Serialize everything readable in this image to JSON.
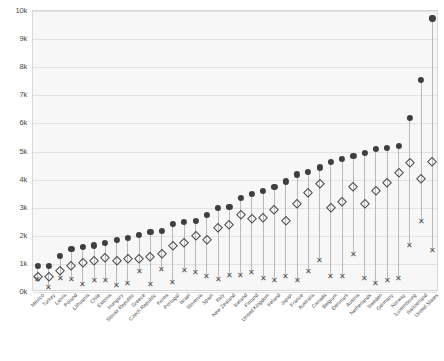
{
  "chart_data": {
    "type": "scatter",
    "title": "",
    "subtitle": "",
    "xlabel": "",
    "ylabel": "",
    "ylim": [
      0,
      10000
    ],
    "yticks": [
      0,
      1000,
      2000,
      3000,
      4000,
      5000,
      6000,
      7000,
      8000,
      9000,
      10000
    ],
    "ytick_labels": [
      "0k",
      "1k",
      "2k",
      "3k",
      "4k",
      "5k",
      "6k",
      "7k",
      "8k",
      "9k",
      "10k"
    ],
    "grid": true,
    "legend_position": "none",
    "categories": [
      "Mexico",
      "Turkey",
      "Latvia",
      "Poland",
      "Lithuania",
      "Chile",
      "Estonia",
      "Hungary",
      "Slovak Republic",
      "Greece",
      "Czech Republic",
      "Korea",
      "Portugal",
      "Israel",
      "Slovenia",
      "Spain",
      "Italy",
      "New Zealand",
      "Iceland",
      "Finland",
      "United Kingdom",
      "Ireland",
      "Japan",
      "France",
      "Australia",
      "Canada",
      "Belgium",
      "Denmark",
      "Austria",
      "Netherlands",
      "Sweden",
      "Germany",
      "Norway",
      "Luxembourg",
      "Switzerland",
      "United States"
    ],
    "series": [
      {
        "name": "total",
        "marker": "filled-circle",
        "color": "#3f3f3f",
        "values": [
          880,
          900,
          1250,
          1500,
          1560,
          1620,
          1700,
          1830,
          1900,
          2000,
          2100,
          2150,
          2400,
          2450,
          2500,
          2700,
          2950,
          3000,
          3300,
          3450,
          3550,
          3700,
          3900,
          4150,
          4250,
          4400,
          4600,
          4700,
          4800,
          4900,
          5050,
          5100,
          5150,
          6150,
          7500,
          9700
        ]
      },
      {
        "name": "middle",
        "marker": "open-diamond",
        "color": "#4a4a4a",
        "values": [
          490,
          500,
          720,
          900,
          1000,
          1080,
          1180,
          1060,
          1150,
          1150,
          1200,
          1300,
          1600,
          1700,
          1950,
          1800,
          2250,
          2350,
          2700,
          2550,
          2600,
          2900,
          2500,
          3100,
          3500,
          3800,
          2950,
          3150,
          3700,
          3100,
          3550,
          3850,
          4200,
          4550,
          4000,
          4600
        ]
      },
      {
        "name": "lowest",
        "marker": "cross",
        "color": "#4d4d4d",
        "values": [
          420,
          130,
          450,
          440,
          240,
          380,
          390,
          200,
          290,
          700,
          260,
          800,
          330,
          750,
          670,
          540,
          420,
          580,
          570,
          660,
          450,
          400,
          520,
          380,
          700,
          1120,
          520,
          540,
          1320,
          450,
          280,
          400,
          460,
          1620,
          2500,
          1450
        ]
      }
    ]
  },
  "caption": {
    "text": ""
  }
}
